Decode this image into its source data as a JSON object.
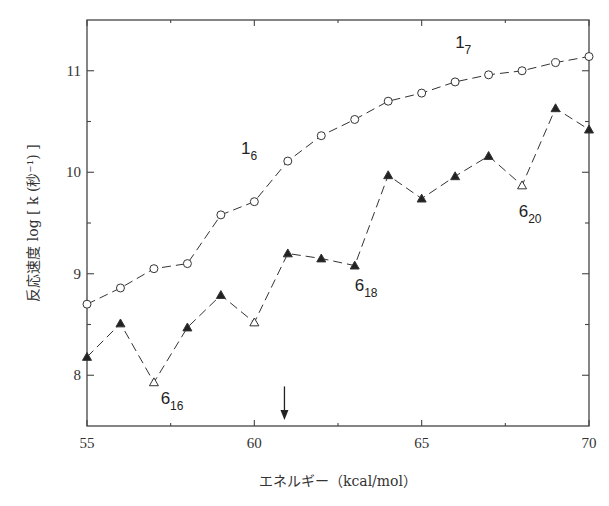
{
  "chart_data": {
    "type": "line",
    "title": "",
    "xlabel": "エネルギー（kcal/mol）",
    "ylabel": "反応速度 log [ k (秒⁻¹) ]",
    "xlim": [
      55,
      70
    ],
    "ylim": [
      7.5,
      11.5
    ],
    "xticks": [
      55,
      60,
      65,
      70
    ],
    "xtick_labels": [
      "55",
      "60",
      "65",
      "70"
    ],
    "x_minor_ticks": [
      57.5,
      62.5,
      67.5
    ],
    "yticks": [
      8,
      9,
      10,
      11
    ],
    "ytick_labels": [
      "8",
      "9",
      "10",
      "11"
    ],
    "y_minor_ticks": [
      8.5,
      9.5,
      10.5
    ],
    "grid": false,
    "legend": null,
    "x": [
      55,
      56,
      57,
      58,
      59,
      60,
      61,
      62,
      63,
      64,
      65,
      66,
      67,
      68,
      69,
      70
    ],
    "series": [
      {
        "name": "1 (circles)",
        "marker": "circle",
        "values": [
          8.7,
          8.86,
          9.05,
          9.1,
          9.58,
          9.71,
          10.11,
          10.36,
          10.52,
          10.7,
          10.78,
          10.89,
          10.96,
          11.0,
          11.08,
          11.14
        ]
      },
      {
        "name": "6 (triangles)",
        "marker": "triangle",
        "values": [
          8.18,
          8.51,
          7.93,
          8.47,
          8.79,
          8.52,
          9.2,
          9.15,
          9.08,
          9.97,
          9.74,
          9.96,
          10.16,
          9.87,
          10.63,
          10.42
        ],
        "filled": [
          true,
          true,
          false,
          true,
          true,
          false,
          true,
          true,
          true,
          true,
          true,
          true,
          true,
          false,
          true,
          true
        ]
      }
    ],
    "annotations": [
      {
        "base": "1",
        "sub": "6",
        "x": 59.6,
        "y": 10.18
      },
      {
        "base": "1",
        "sub": "7",
        "x": 66.0,
        "y": 11.22
      },
      {
        "base": "6",
        "sub": "16",
        "x": 57.2,
        "y": 7.72
      },
      {
        "base": "6",
        "sub": "18",
        "x": 63.0,
        "y": 8.83
      },
      {
        "base": "6",
        "sub": "20",
        "x": 67.9,
        "y": 9.56
      }
    ],
    "arrow": {
      "x": 60.9,
      "y_top": 7.89,
      "y_bottom": 7.56,
      "direction": "down"
    }
  }
}
